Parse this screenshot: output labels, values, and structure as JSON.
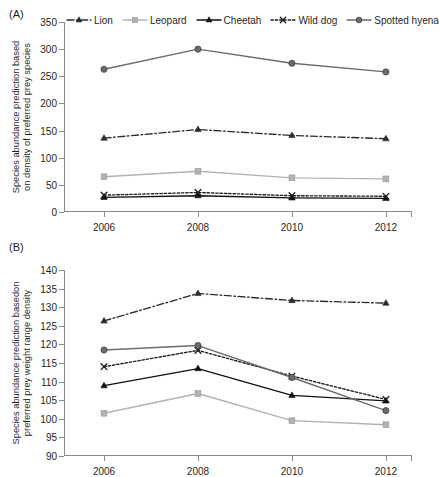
{
  "figure": {
    "panel_a_tag": "(A)",
    "panel_b_tag": "(B)"
  },
  "legend": {
    "position": "top",
    "items": [
      {
        "name": "Lion",
        "label": "Lion",
        "color": "#2b2b2b",
        "marker": "triangle",
        "dash": "dashdot"
      },
      {
        "name": "Leopard",
        "label": "Leopard",
        "color": "#b3b3b3",
        "marker": "square",
        "dash": "solid"
      },
      {
        "name": "Cheetah",
        "label": "Cheetah",
        "color": "#111111",
        "marker": "triangle",
        "dash": "solid"
      },
      {
        "name": "Wild dog",
        "label": "Wild dog",
        "color": "#1c1c1c",
        "marker": "cross",
        "dash": "dotted"
      },
      {
        "name": "Spotted hyena",
        "label": "Spotted hyena",
        "color": "#6b6b6b",
        "marker": "circle",
        "dash": "solid"
      }
    ]
  },
  "chart_data": [
    {
      "id": "panel-a",
      "panel": "(A)",
      "type": "line",
      "title": "",
      "xlabel": "",
      "ylabel": "Species abundance prediction based on density of preferred prey species",
      "ylabel_line1": "Species abundance prediction based",
      "ylabel_line2": "on density of preferred prey species",
      "categories": [
        "2006",
        "2008",
        "2010",
        "2012"
      ],
      "x": [
        2006,
        2008,
        2010,
        2012
      ],
      "ylim": [
        0,
        350
      ],
      "yticks": [
        0,
        50,
        100,
        150,
        200,
        250,
        300,
        350
      ],
      "ytick_labels": [
        "0",
        "50",
        "100",
        "150",
        "200",
        "250",
        "300",
        "350"
      ],
      "grid": false,
      "series": [
        {
          "name": "Lion",
          "color": "#2b2b2b",
          "marker": "triangle",
          "dash": "dashdot",
          "values": [
            136,
            152,
            141,
            135
          ]
        },
        {
          "name": "Leopard",
          "color": "#b3b3b3",
          "marker": "square",
          "dash": "solid",
          "values": [
            65,
            75,
            63,
            61
          ]
        },
        {
          "name": "Cheetah",
          "color": "#111111",
          "marker": "triangle",
          "dash": "solid",
          "values": [
            27,
            30,
            26,
            25
          ]
        },
        {
          "name": "Wild dog",
          "color": "#1c1c1c",
          "marker": "cross",
          "dash": "dotted",
          "values": [
            31,
            36,
            30,
            29
          ]
        },
        {
          "name": "Spotted hyena",
          "color": "#6b6b6b",
          "marker": "circle",
          "dash": "solid",
          "values": [
            263,
            300,
            274,
            258
          ]
        }
      ]
    },
    {
      "id": "panel-b",
      "panel": "(B)",
      "type": "line",
      "title": "",
      "xlabel": "",
      "ylabel": "Species abundance prediction basedon preferred prey weight range density",
      "ylabel_line1": "Species abundance prediction basedon",
      "ylabel_line2": "preferred prey weight range density",
      "categories": [
        "2006",
        "2008",
        "2010",
        "2012"
      ],
      "x": [
        2006,
        2008,
        2010,
        2012
      ],
      "ylim": [
        90,
        140
      ],
      "yticks": [
        90,
        95,
        100,
        105,
        110,
        115,
        120,
        125,
        130,
        135,
        140
      ],
      "ytick_labels": [
        "90",
        "95",
        "100",
        "105",
        "110",
        "115",
        "120",
        "125",
        "130",
        "135",
        "140"
      ],
      "grid": false,
      "series": [
        {
          "name": "Lion",
          "color": "#2b2b2b",
          "marker": "triangle",
          "dash": "dashdot",
          "values": [
            126.3,
            133.7,
            131.8,
            131.1
          ]
        },
        {
          "name": "Leopard",
          "color": "#b3b3b3",
          "marker": "square",
          "dash": "solid",
          "values": [
            101.5,
            106.8,
            99.5,
            98.4
          ]
        },
        {
          "name": "Cheetah",
          "color": "#111111",
          "marker": "triangle",
          "dash": "solid",
          "values": [
            108.9,
            113.5,
            106.3,
            104.8
          ]
        },
        {
          "name": "Wild dog",
          "color": "#1c1c1c",
          "marker": "cross",
          "dash": "dotted",
          "values": [
            114.0,
            118.4,
            111.5,
            105.2
          ]
        },
        {
          "name": "Spotted hyena",
          "color": "#6b6b6b",
          "marker": "circle",
          "dash": "solid",
          "values": [
            118.5,
            119.7,
            111.1,
            102.2
          ]
        }
      ]
    }
  ]
}
